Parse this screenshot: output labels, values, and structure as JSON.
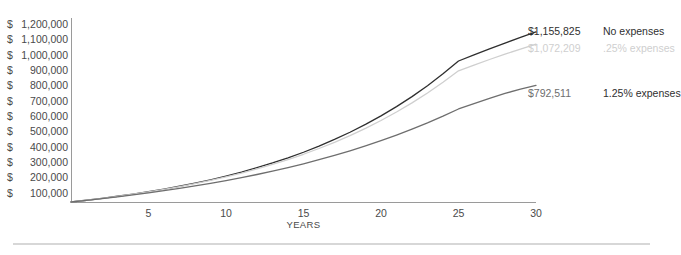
{
  "top_remnant": "",
  "chart_data": {
    "type": "line",
    "title": "",
    "subtitle": "",
    "xlabel": "YEARS",
    "ylabel": "",
    "x": [
      0,
      1,
      2,
      3,
      4,
      5,
      6,
      7,
      8,
      9,
      10,
      11,
      12,
      13,
      14,
      15,
      16,
      17,
      18,
      19,
      20,
      21,
      22,
      23,
      24,
      25,
      26,
      27,
      28,
      29,
      30
    ],
    "xlim": [
      0,
      30
    ],
    "ylim": [
      0,
      1250000
    ],
    "x_ticks": [
      5,
      10,
      15,
      20,
      25,
      30
    ],
    "x_tick_labels": [
      "5",
      "10",
      "15",
      "20",
      "25",
      "30"
    ],
    "y_ticks": [
      100000,
      200000,
      300000,
      400000,
      500000,
      600000,
      700000,
      800000,
      900000,
      1000000,
      1100000,
      1200000
    ],
    "y_tick_labels": [
      "1,200,000",
      "1,100,000",
      "1,000,000",
      "900,000",
      "800,000",
      "700,000",
      "600,000",
      "500,000",
      "400,000",
      "300,000",
      "200,000",
      "100,000"
    ],
    "y_tick_currency": "$",
    "grid": false,
    "legend": "data-labels-right",
    "series": [
      {
        "name": "No expenses",
        "color": "#2f2f2f",
        "end_value_label": "$1,155,825",
        "end_value": 1155825,
        "values": [
          0,
          12000,
          25000,
          39000,
          54000,
          70000,
          88000,
          107000,
          128000,
          151000,
          176000,
          203000,
          233000,
          265000,
          300000,
          338000,
          380000,
          425000,
          474000,
          527000,
          585000,
          648000,
          716000,
          790000,
          871000,
          958000,
          1000000,
          1040000,
          1080000,
          1118000,
          1155825
        ]
      },
      {
        "name": ".25% expenses",
        "color": "#cfcfcf",
        "end_value_label": "$1,072,209",
        "end_value": 1072209,
        "values": [
          0,
          11900,
          24700,
          38400,
          53100,
          68800,
          86200,
          104700,
          124800,
          146800,
          170800,
          196600,
          224900,
          255300,
          288600,
          324300,
          363500,
          405500,
          451200,
          500400,
          553800,
          611300,
          673500,
          740600,
          813200,
          891500,
          930000,
          968000,
          1004000,
          1039000,
          1072209
        ]
      },
      {
        "name": "1.25% expenses",
        "color": "#6e6e6e",
        "end_value_label": "$792,511",
        "end_value": 792511,
        "values": [
          0,
          11200,
          23000,
          35400,
          48500,
          62300,
          77000,
          92600,
          109200,
          126800,
          145600,
          165600,
          186900,
          209600,
          233800,
          259600,
          287100,
          316400,
          347600,
          380900,
          416400,
          454200,
          494500,
          537400,
          583200,
          632000,
          668000,
          704000,
          738000,
          766000,
          792511
        ]
      }
    ]
  }
}
